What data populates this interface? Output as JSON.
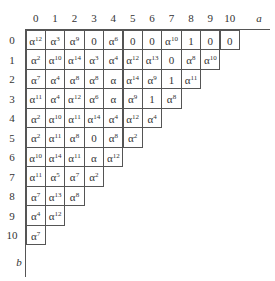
{
  "axes": {
    "x_label": "a",
    "y_label": "b",
    "col_labels": [
      "0",
      "1",
      "2",
      "3",
      "4",
      "5",
      "6",
      "7",
      "8",
      "9",
      "10"
    ],
    "row_labels": [
      "0",
      "1",
      "2",
      "3",
      "4",
      "5",
      "6",
      "7",
      "8",
      "9",
      "10"
    ]
  },
  "table": [
    [
      "α^12",
      "α^3",
      "α^9",
      "0",
      "α^6",
      "0",
      "0",
      "α^10",
      "1",
      "0",
      "0"
    ],
    [
      "α^2",
      "α^10",
      "α^14",
      "α^3",
      "α^4",
      "α^12",
      "α^13",
      "0",
      "α^8",
      "α^10"
    ],
    [
      "α^7",
      "α^4",
      "α^8",
      "α^8",
      "α",
      "α^14",
      "α^9",
      "1",
      "α^11"
    ],
    [
      "α^11",
      "α^4",
      "α^12",
      "α^6",
      "α",
      "α^9",
      "1",
      "α^8"
    ],
    [
      "α^2",
      "α^10",
      "α^11",
      "α^14",
      "α^4",
      "α^12",
      "α^4"
    ],
    [
      "α^2",
      "α^11",
      "α^8",
      "0",
      "α^8",
      "α^2"
    ],
    [
      "α^10",
      "α^14",
      "α^11",
      "α",
      "α^12"
    ],
    [
      "α^11",
      "α^5",
      "α^7",
      "α^2"
    ],
    [
      "α^7",
      "α^13",
      "α^8"
    ],
    [
      "α^4",
      "α^12"
    ],
    [
      "α^7"
    ]
  ]
}
